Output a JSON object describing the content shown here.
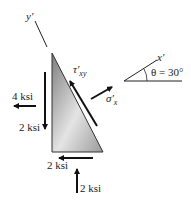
{
  "diagram": {
    "axes": {
      "y_prime": "y′",
      "x_prime": "x′",
      "angle_label": "θ = 30°"
    },
    "stresses": {
      "tau_label": "τ′",
      "tau_sub": "xy",
      "sigma_label": "σ′",
      "sigma_sub": "x",
      "left_horizontal": "4 ksi",
      "left_vertical": "2 ksi",
      "bottom_horizontal": "2 ksi",
      "bottom_vertical": "2 ksi"
    },
    "colors": {
      "arrow": "#111111",
      "element_dark": "#8a8a8a",
      "element_light": "#e6e6e6"
    }
  }
}
